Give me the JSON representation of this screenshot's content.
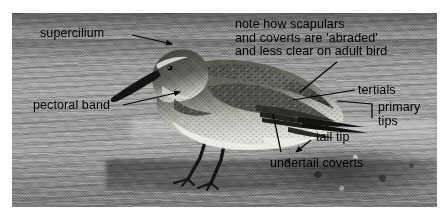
{
  "figure": {
    "type": "annotated-photograph",
    "palette": {
      "text": "#000000",
      "leader": "#000000",
      "photo_light": "#a8a8a8",
      "photo_dark": "#2b2b2b",
      "page_background": "#ffffff"
    }
  },
  "annotations": [
    {
      "id": "supercilium",
      "label": "supercilium",
      "x": 40,
      "y": 27,
      "leader": {
        "from": [
          132,
          35
        ],
        "to": [
          172,
          44
        ],
        "arrow": true
      }
    },
    {
      "id": "note",
      "label": "note how scapulars\nand coverts are 'abraded'\nand less clear on adult bird",
      "x": 235,
      "y": 18,
      "leader": {
        "from": [
          337,
          62
        ],
        "to": [
          300,
          92
        ],
        "arrow": false
      }
    },
    {
      "id": "pectoral-band",
      "label": "pectoral band",
      "x": 33,
      "y": 99,
      "leader": {
        "from": [
          123,
          105
        ],
        "to": [
          180,
          92
        ],
        "arrow": true
      }
    },
    {
      "id": "tertials",
      "label": "tertials",
      "x": 358,
      "y": 84,
      "leader": {
        "from": [
          355,
          90
        ],
        "to": [
          293,
          100
        ],
        "arrow": false
      }
    },
    {
      "id": "primary-tips",
      "label": "primary\ntips",
      "x": 378,
      "y": 101,
      "leader": {
        "from": [
          372,
          118
        ],
        "to": [
          372,
          104
        ],
        "arrow": false
      },
      "leader2": {
        "from": [
          372,
          104
        ],
        "to": [
          337,
          101
        ],
        "arrow": false
      }
    },
    {
      "id": "tail-tip",
      "label": "tail tip",
      "x": 316,
      "y": 131,
      "leader": {
        "from": [
          311,
          140
        ],
        "to": [
          296,
          152
        ],
        "arrow": true
      }
    },
    {
      "id": "undertail-coverts",
      "label": "undertail coverts",
      "x": 270,
      "y": 157,
      "leader": {
        "from": [
          281,
          152
        ],
        "to": [
          273,
          114
        ],
        "arrow": false
      }
    }
  ]
}
